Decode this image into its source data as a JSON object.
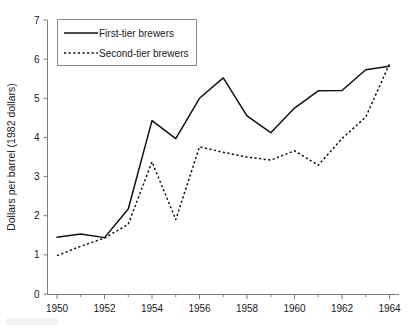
{
  "chart_data": {
    "type": "line",
    "title": "",
    "xlabel": "",
    "ylabel": "Dollars per barrel (1982 dollars)",
    "xlim": [
      1949.6,
      1964.4
    ],
    "ylim": [
      0,
      7
    ],
    "grid": false,
    "legend_position": "top-left",
    "x": [
      1950,
      1951,
      1952,
      1953,
      1954,
      1955,
      1956,
      1957,
      1958,
      1959,
      1960,
      1961,
      1962,
      1963,
      1964
    ],
    "xticks": [
      1950,
      1952,
      1954,
      1956,
      1958,
      1960,
      1962,
      1964
    ],
    "xticklabels": [
      "1950",
      "1952",
      "1954",
      "1956",
      "1958",
      "1960",
      "1962",
      "1964"
    ],
    "xminorticks": [
      1951,
      1953,
      1955,
      1957,
      1959,
      1961,
      1963
    ],
    "yticks": [
      0,
      1,
      2,
      3,
      4,
      5,
      6,
      7
    ],
    "yticklabels": [
      "0",
      "1",
      "2",
      "3",
      "4",
      "5",
      "6",
      "7"
    ],
    "series": [
      {
        "name": "First-tier brewers",
        "style": "solid",
        "color": "#111111",
        "values": [
          1.45,
          1.53,
          1.44,
          2.17,
          4.43,
          3.97,
          5.0,
          5.52,
          4.55,
          4.12,
          4.75,
          5.19,
          5.2,
          5.73,
          5.82
        ]
      },
      {
        "name": "Second-tier brewers",
        "style": "dotted",
        "color": "#111111",
        "values": [
          0.98,
          1.22,
          1.43,
          1.78,
          3.38,
          1.9,
          3.76,
          3.62,
          3.5,
          3.42,
          3.66,
          3.29,
          3.97,
          4.52,
          5.88
        ]
      }
    ],
    "legend": [
      {
        "label": "First-tier brewers",
        "style": "solid"
      },
      {
        "label": "Second-tier brewers",
        "style": "dotted"
      }
    ]
  }
}
